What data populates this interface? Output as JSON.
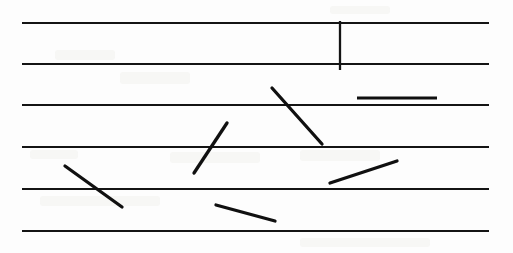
{
  "document": {
    "kind": "scanned-ruled-paper",
    "title": "Handwriting stroke sample on ruled paper",
    "width": 513,
    "height": 253,
    "background_color": "#fdfdfd",
    "ink_color": "#101010",
    "rule_color": "#141414",
    "smudge_color": "#efeeec"
  },
  "ruled_lines": [
    {
      "name": "rule-1",
      "x1": 22,
      "y1": 23,
      "x2": 489,
      "y2": 23
    },
    {
      "name": "rule-2",
      "x1": 22,
      "y1": 64,
      "x2": 489,
      "y2": 64
    },
    {
      "name": "rule-3",
      "x1": 22,
      "y1": 105,
      "x2": 489,
      "y2": 105
    },
    {
      "name": "rule-4",
      "x1": 22,
      "y1": 147,
      "x2": 489,
      "y2": 147
    },
    {
      "name": "rule-5",
      "x1": 22,
      "y1": 189,
      "x2": 489,
      "y2": 189
    },
    {
      "name": "rule-6",
      "x1": 22,
      "y1": 231,
      "x2": 489,
      "y2": 231
    }
  ],
  "marks": [
    {
      "name": "vertical-tick",
      "type": "vertical",
      "x1": 340,
      "y1": 21,
      "x2": 340,
      "y2": 70
    },
    {
      "name": "horizontal-dash",
      "type": "horizontal",
      "x1": 357,
      "y1": 98,
      "x2": 437,
      "y2": 98
    },
    {
      "name": "stroke-down-right-long",
      "type": "diagonal",
      "x1": 272,
      "y1": 88,
      "x2": 322,
      "y2": 144
    },
    {
      "name": "stroke-up-right-mid",
      "type": "diagonal",
      "x1": 194,
      "y1": 173,
      "x2": 227,
      "y2": 123
    },
    {
      "name": "stroke-down-right-left",
      "type": "diagonal",
      "x1": 65,
      "y1": 166,
      "x2": 122,
      "y2": 207
    },
    {
      "name": "stroke-up-right-right",
      "type": "diagonal",
      "x1": 330,
      "y1": 183,
      "x2": 397,
      "y2": 161
    },
    {
      "name": "stroke-down-right-bottom",
      "type": "diagonal",
      "x1": 216,
      "y1": 205,
      "x2": 275,
      "y2": 221
    }
  ],
  "smudges": [
    {
      "name": "smudge-upper-left",
      "x": 55,
      "y": 50,
      "w": 60,
      "h": 10
    },
    {
      "name": "smudge-upper-mid",
      "x": 120,
      "y": 72,
      "w": 70,
      "h": 12
    },
    {
      "name": "smudge-left-low",
      "x": 30,
      "y": 150,
      "w": 48,
      "h": 9
    },
    {
      "name": "smudge-center-low",
      "x": 170,
      "y": 152,
      "w": 90,
      "h": 11
    },
    {
      "name": "smudge-right-low",
      "x": 300,
      "y": 150,
      "w": 80,
      "h": 11
    },
    {
      "name": "smudge-bottom-band",
      "x": 40,
      "y": 196,
      "w": 120,
      "h": 10
    },
    {
      "name": "smudge-bottom-right",
      "x": 300,
      "y": 238,
      "w": 130,
      "h": 9
    },
    {
      "name": "smudge-top-right",
      "x": 330,
      "y": 6,
      "w": 60,
      "h": 8
    }
  ]
}
